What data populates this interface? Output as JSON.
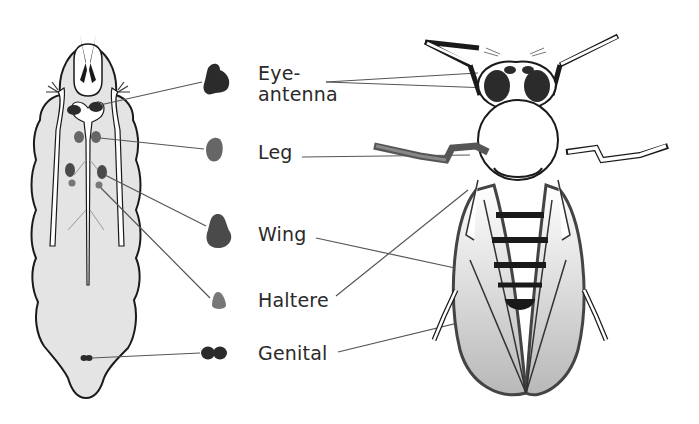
{
  "diagram": {
    "larva": {
      "name": "larva"
    },
    "adult": {
      "name": "adult fly"
    },
    "labels": [
      {
        "id": "eye-antenna",
        "line1": "Eye-",
        "line2": "antenna"
      },
      {
        "id": "leg",
        "text": "Leg"
      },
      {
        "id": "wing",
        "text": "Wing"
      },
      {
        "id": "haltere",
        "text": "Haltere"
      },
      {
        "id": "genital",
        "text": "Genital"
      }
    ],
    "colors": {
      "larva_fill": "#e4e4e4",
      "outline": "#1a1a1a",
      "disc_dark": "#2b2b2b",
      "disc_mid": "#555555",
      "disc_light": "#777777",
      "leader_line": "#555555"
    }
  }
}
